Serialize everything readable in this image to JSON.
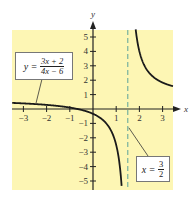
{
  "chart_data": {
    "type": "line",
    "title": "",
    "xlabel": "x",
    "ylabel": "y",
    "xlim": [
      -3.5,
      3.5
    ],
    "ylim": [
      -5.4,
      5.6
    ],
    "x_ticks": [
      -3,
      -2,
      -1,
      1,
      2,
      3
    ],
    "x_tick_labels": [
      "−3",
      "−2",
      "−1",
      "1",
      "2",
      "3"
    ],
    "y_ticks": [
      -5,
      -4,
      -3,
      -2,
      -1,
      1,
      2,
      3,
      4,
      5
    ],
    "y_tick_labels": [
      "−5",
      "−4",
      "−3",
      "−2",
      "−1",
      "1",
      "2",
      "3",
      "4",
      "5"
    ],
    "grid": false,
    "series": [
      {
        "name": "y = (3x + 2)/(4x − 6)",
        "function": "(3x+2)/(4x-6)",
        "numerator": "3x + 2",
        "denominator": "4x − 6",
        "color": "#1a1a1a"
      }
    ],
    "asymptotes": [
      {
        "type": "vertical",
        "x": 1.5,
        "label_lhs": "x",
        "label_num": "3",
        "label_den": "2",
        "color": "#5aa39a",
        "style": "dashed"
      }
    ],
    "annotations": [
      {
        "text": "y = (3x + 2)/(4x − 6)",
        "points_to": [
          -2.4,
          0.35
        ]
      },
      {
        "text": "x = 3/2",
        "points_to": [
          1.5,
          -1.2
        ]
      }
    ],
    "colors": {
      "plot_background": "#fdf6b4",
      "axis": "#222222",
      "curve": "#1a1a1a",
      "asymptote": "#5aa39a"
    }
  },
  "fn_label": {
    "lhs": "y",
    "eq": "=",
    "num": "3x + 2",
    "den": "4x − 6"
  },
  "asym_label": {
    "lhs": "x",
    "eq": "=",
    "num": "3",
    "den": "2"
  }
}
